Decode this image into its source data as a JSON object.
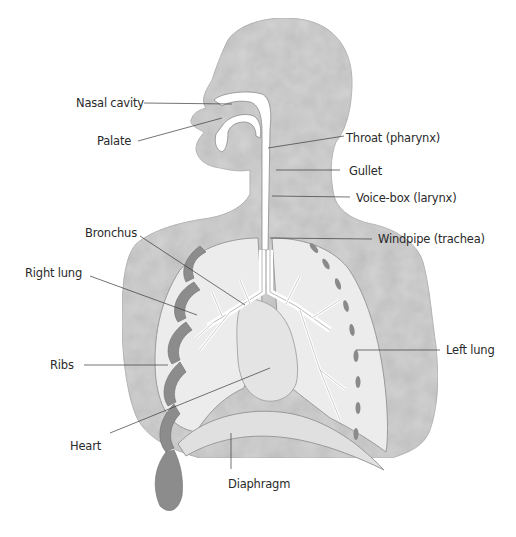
{
  "diagram": {
    "type": "anatomical-illustration",
    "colors": {
      "body_fill": "#d4d4d4",
      "lung_fill": "#ececec",
      "airway_fill": "#ffffff",
      "rib_fill": "#8c8c8c",
      "outline": "#8a8a8a",
      "leader_line": "#3a3a3a",
      "label_text": "#2a2a2a"
    },
    "labels": [
      {
        "id": "nasal-cavity",
        "text": "Nasal cavity",
        "x": 76,
        "y": 96,
        "side": "left",
        "target": [
          232,
          104
        ]
      },
      {
        "id": "palate",
        "text": "Palate",
        "x": 97,
        "y": 134,
        "side": "left",
        "target": [
          222,
          118
        ]
      },
      {
        "id": "throat",
        "text": "Throat (pharynx)",
        "x": 346,
        "y": 131,
        "side": "right",
        "target": [
          268,
          148
        ]
      },
      {
        "id": "gullet",
        "text": "Gullet",
        "x": 349,
        "y": 164,
        "side": "right",
        "target": [
          276,
          170
        ]
      },
      {
        "id": "voice-box",
        "text": "Voice-box (larynx)",
        "x": 356,
        "y": 191,
        "side": "right",
        "target": [
          272,
          196
        ]
      },
      {
        "id": "windpipe",
        "text": "Windpipe (trachea)",
        "x": 378,
        "y": 232,
        "side": "right",
        "target": [
          270,
          238
        ]
      },
      {
        "id": "bronchus",
        "text": "Bronchus",
        "x": 85,
        "y": 226,
        "side": "left",
        "target": [
          245,
          305
        ]
      },
      {
        "id": "right-lung",
        "text": "Right lung",
        "x": 25,
        "y": 266,
        "side": "left",
        "target": [
          197,
          315
        ]
      },
      {
        "id": "ribs",
        "text": "Ribs",
        "x": 50,
        "y": 358,
        "side": "left",
        "target": [
          168,
          365
        ]
      },
      {
        "id": "left-lung",
        "text": "Left lung",
        "x": 446,
        "y": 343,
        "side": "right",
        "target": [
          356,
          350
        ]
      },
      {
        "id": "heart",
        "text": "Heart",
        "x": 70,
        "y": 439,
        "side": "left",
        "target": [
          270,
          368
        ]
      },
      {
        "id": "diaphragm",
        "text": "Diaphragm",
        "x": 228,
        "y": 477,
        "side": "below",
        "target": [
          231,
          433
        ]
      }
    ],
    "cropped_text": "····"
  }
}
